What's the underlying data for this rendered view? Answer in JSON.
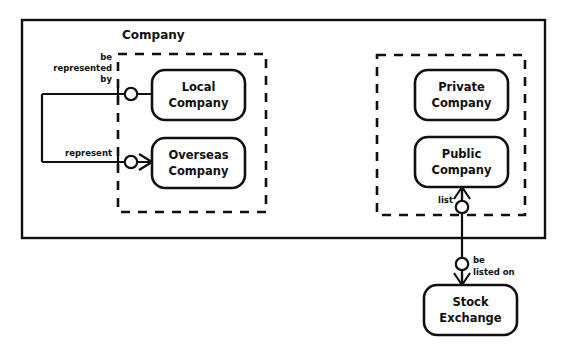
{
  "diagram": {
    "type": "entity-relationship-diagram",
    "notation": "crows-foot",
    "container": {
      "name": "outer-frame",
      "label": ""
    },
    "groups": [
      {
        "id": "company-subtype-group-left",
        "title": "Company",
        "style": "dashed",
        "entities": [
          "local-company",
          "overseas-company"
        ]
      },
      {
        "id": "company-subtype-group-right",
        "title": "",
        "style": "dashed",
        "entities": [
          "private-company",
          "public-company"
        ]
      }
    ],
    "entities": [
      {
        "id": "local-company",
        "line1": "Local",
        "line2": "Company"
      },
      {
        "id": "overseas-company",
        "line1": "Overseas",
        "line2": "Company"
      },
      {
        "id": "private-company",
        "line1": "Private",
        "line2": "Company"
      },
      {
        "id": "public-company",
        "line1": "Public",
        "line2": "Company"
      },
      {
        "id": "stock-exchange",
        "line1": "Stock",
        "line2": "Exchange"
      }
    ],
    "relationships": [
      {
        "id": "be-represented-by",
        "label_lines": [
          "be",
          "represented",
          "by"
        ],
        "from": "overseas-company",
        "to": "local-company",
        "from_cardinality": "one-mandatory",
        "to_cardinality": "zero-or-one"
      },
      {
        "id": "represent",
        "label_lines": [
          "represent"
        ],
        "from": "local-company",
        "to": "overseas-company",
        "from_cardinality": "one-mandatory",
        "to_cardinality": "zero-or-many"
      },
      {
        "id": "list",
        "label_lines": [
          "list"
        ],
        "from": "public-company",
        "to": "stock-exchange",
        "from_cardinality": "many",
        "to_cardinality": "zero-or-many"
      },
      {
        "id": "be-listed-on",
        "label_lines": [
          "be",
          "listed on"
        ],
        "from": "stock-exchange",
        "to": "public-company",
        "from_cardinality": "zero-or-one",
        "to_cardinality": "many"
      }
    ],
    "colors": {
      "stroke": "#101010",
      "background": "#ffffff"
    }
  }
}
